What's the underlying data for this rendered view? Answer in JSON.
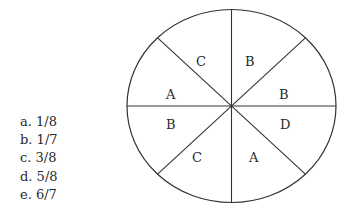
{
  "spinner": {
    "center": [
      231.5,
      106
    ],
    "rx": 104.5,
    "ry": 96.5,
    "stroke_color": "#333333",
    "sectors": [
      {
        "label": "C",
        "pos": [
          196,
          66
        ]
      },
      {
        "label": "B",
        "pos": [
          248,
          66
        ]
      },
      {
        "label": "A",
        "pos": [
          170,
          94
        ]
      },
      {
        "label": "B",
        "pos": [
          282,
          94
        ]
      },
      {
        "label": "B",
        "pos": [
          170,
          125
        ]
      },
      {
        "label": "D",
        "pos": [
          284,
          125
        ]
      },
      {
        "label": "C",
        "pos": [
          195,
          158
        ]
      },
      {
        "label": "A",
        "pos": [
          253,
          158
        ]
      }
    ]
  },
  "choices": [
    {
      "letter": "a.",
      "value": "1/8"
    },
    {
      "letter": "b.",
      "value": "1/7"
    },
    {
      "letter": "c.",
      "value": "3/8"
    },
    {
      "letter": "d.",
      "value": "5/8"
    },
    {
      "letter": "e.",
      "value": "6/7"
    }
  ]
}
